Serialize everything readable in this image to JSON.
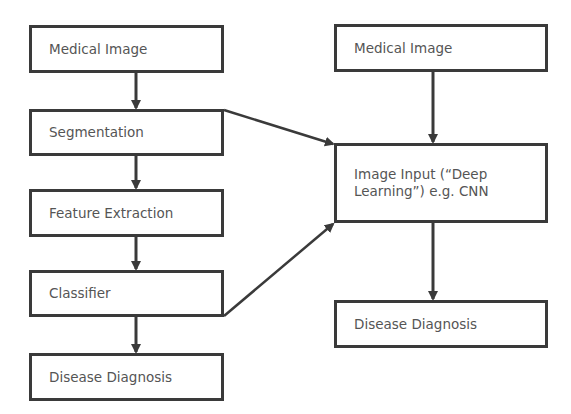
{
  "diagram": {
    "left_pipeline": {
      "nodes": [
        {
          "id": "l1",
          "label": "Medical Image",
          "x": 29,
          "y": 25,
          "w": 195,
          "h": 48
        },
        {
          "id": "l2",
          "label": "Segmentation",
          "x": 29,
          "y": 109,
          "w": 195,
          "h": 47
        },
        {
          "id": "l3",
          "label": "Feature Extraction",
          "x": 29,
          "y": 189,
          "w": 195,
          "h": 48
        },
        {
          "id": "l4",
          "label": "Classifier",
          "x": 29,
          "y": 270,
          "w": 195,
          "h": 47
        },
        {
          "id": "l5",
          "label": "Disease Diagnosis",
          "x": 29,
          "y": 353,
          "w": 195,
          "h": 48
        }
      ]
    },
    "right_pipeline": {
      "nodes": [
        {
          "id": "r1",
          "label": "Medical Image",
          "x": 334,
          "y": 24,
          "w": 214,
          "h": 48
        },
        {
          "id": "r2",
          "label": "Image Input (“Deep Learning”) e.g. CNN",
          "x": 334,
          "y": 143,
          "w": 214,
          "h": 80
        },
        {
          "id": "r3",
          "label": "Disease Diagnosis",
          "x": 334,
          "y": 300,
          "w": 214,
          "h": 48
        }
      ]
    },
    "edges": [
      {
        "from": "l1",
        "to": "l2"
      },
      {
        "from": "l2",
        "to": "l3"
      },
      {
        "from": "l3",
        "to": "l4"
      },
      {
        "from": "l4",
        "to": "l5"
      },
      {
        "from": "r1",
        "to": "r2"
      },
      {
        "from": "r2",
        "to": "r3"
      },
      {
        "from": "l2",
        "to": "r2"
      },
      {
        "from": "l4",
        "to": "r2"
      }
    ],
    "colors": {
      "stroke": "#3a3a3a",
      "text": "#555555",
      "background": "#ffffff"
    }
  }
}
